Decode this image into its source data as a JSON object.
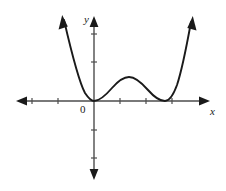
{
  "figure": {
    "kind": "cartesian-graph",
    "width": 226,
    "height": 191,
    "background_color": "#ffffff",
    "stroke_color": "#1a1a1a",
    "axis_color": "#4d4d4d"
  },
  "labels": {
    "x_axis": "x",
    "y_axis": "y",
    "origin": "0"
  },
  "chart_data": {
    "type": "line",
    "title": "",
    "xlabel": "x",
    "ylabel": "y",
    "grid": false,
    "legend": null,
    "axis_style": {
      "arrows": [
        "left",
        "right",
        "up",
        "down"
      ],
      "tick_length_px": 6,
      "tick_spacing_px": 26
    },
    "x_axis_pixel_y": 101,
    "y_axis_pixel_x": 94,
    "x_ticks_pixel": [
      32,
      58,
      120,
      146,
      172
    ],
    "y_ticks_pixel": [
      34,
      62,
      130,
      158
    ],
    "curve_description": "Quartic-like polynomial with two double roots: it touches the x-axis at the origin, rises to a local maximum, returns to touch the x-axis again further right, then increases steeply; both ends terminate in arrowheads.",
    "roots": [
      {
        "label": "origin double root",
        "x_px": 94,
        "y_px": 101,
        "multiplicity": 2
      },
      {
        "label": "right double root",
        "x_px": 165,
        "y_px": 101,
        "multiplicity": 2
      }
    ],
    "local_extrema": [
      {
        "kind": "minimum",
        "x_px": 94,
        "y_px": 101
      },
      {
        "kind": "maximum",
        "x_px": 129,
        "y_px": 77
      },
      {
        "kind": "minimum",
        "x_px": 165,
        "y_px": 101
      }
    ],
    "curve_path": "M 64,20 C 70,46 78,80 85,93 C 89,99 92,101 94,101 C 100,101 106,95 112,88 C 119,80 124,77 129,77 C 135,77 141,82 148,90 C 155,98 160,101 165,101 C 169,101 173,96 177,85 C 182,70 187,44 191,22",
    "curve_endpoints": [
      {
        "end": "left",
        "x_px": 64,
        "y_px": 20,
        "arrow": true,
        "direction": "up-left"
      },
      {
        "end": "right",
        "x_px": 191,
        "y_px": 22,
        "arrow": true,
        "direction": "up-right"
      }
    ],
    "x_extent_px": [
      18,
      208
    ],
    "y_extent_px": [
      18,
      178
    ]
  }
}
